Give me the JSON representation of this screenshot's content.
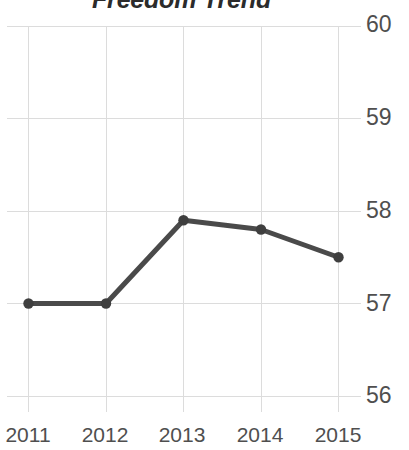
{
  "chart_data": {
    "type": "line",
    "title": "Freedom Trend",
    "xlabel": "",
    "ylabel": "",
    "categories": [
      "2011",
      "2012",
      "2013",
      "2014",
      "2015"
    ],
    "values": [
      57.0,
      57.0,
      57.9,
      57.8,
      57.5
    ],
    "series": [
      {
        "name": "Freedom Trend",
        "values": [
          57.0,
          57.0,
          57.9,
          57.8,
          57.5
        ]
      }
    ],
    "ylim": [
      56,
      60
    ],
    "y_ticks": [
      60,
      59,
      58,
      57,
      56
    ],
    "y_tick_labels": [
      "60",
      "59",
      "58",
      "57",
      "56"
    ],
    "x_tick_labels": [
      "2011",
      "2012",
      "2013",
      "2014",
      "2015"
    ],
    "grid": true,
    "grid_x": true,
    "grid_y": true,
    "legend": false,
    "legend_position": "none",
    "markers": true,
    "marker_shape": "circle",
    "y_axis_position": "right",
    "colors": {
      "line": "#4a4a4a",
      "marker": "#3f3f3f",
      "grid": "#dcdcdc",
      "title_text": "#2b2b2b",
      "tick_text": "#4f4f4f",
      "background": "#ffffff"
    }
  },
  "axes": {
    "y_labels": [
      {
        "text": "60",
        "top": 13
      },
      {
        "text": "59",
        "top": 106
      },
      {
        "text": "58",
        "top": 199
      },
      {
        "text": "57",
        "top": 292
      },
      {
        "text": "56",
        "top": 384
      }
    ],
    "x_labels": [
      {
        "text": "2011",
        "left": -4
      },
      {
        "text": "2012",
        "left": 73
      },
      {
        "text": "2013",
        "left": 150
      },
      {
        "text": "2014",
        "left": 228
      },
      {
        "text": "2015",
        "left": 306
      }
    ]
  }
}
